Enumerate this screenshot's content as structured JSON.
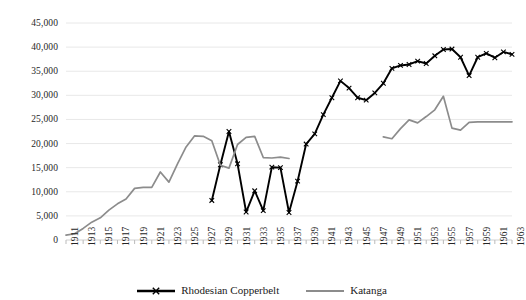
{
  "chart_data": {
    "type": "line",
    "title": "",
    "subtitle": "",
    "xlabel": "",
    "ylabel": "",
    "xlim": [
      1911,
      1963
    ],
    "ylim": [
      0,
      45000
    ],
    "y_ticks": [
      "0",
      "5,000",
      "10,000",
      "15,000",
      "20,000",
      "25,000",
      "30,000",
      "35,000",
      "40,000",
      "45,000"
    ],
    "y_tick_values": [
      0,
      5000,
      10000,
      15000,
      20000,
      25000,
      30000,
      35000,
      40000,
      45000
    ],
    "x_ticks": [
      "1911",
      "1913",
      "1915",
      "1917",
      "1919",
      "1921",
      "1923",
      "1925",
      "1927",
      "1929",
      "1931",
      "1933",
      "1935",
      "1937",
      "1939",
      "1941",
      "1943",
      "1945",
      "1947",
      "1949",
      "1951",
      "1953",
      "1955",
      "1957",
      "1959",
      "1961",
      "1963"
    ],
    "x_tick_values": [
      1911,
      1913,
      1915,
      1917,
      1919,
      1921,
      1923,
      1925,
      1927,
      1929,
      1931,
      1933,
      1935,
      1937,
      1939,
      1941,
      1943,
      1945,
      1947,
      1949,
      1951,
      1953,
      1955,
      1957,
      1959,
      1961,
      1963
    ],
    "grid": true,
    "grid_axis": "y",
    "legend_position": "bottom",
    "series": [
      {
        "name": "Rhodesian Copperbelt",
        "color": "#000000",
        "marker": "x",
        "x": [
          1928,
          1929,
          1930,
          1931,
          1932,
          1933,
          1934,
          1935,
          1936,
          1937,
          1938,
          1939,
          1940,
          1941,
          1942,
          1943,
          1944,
          1945,
          1946,
          1947,
          1948,
          1949,
          1950,
          1951,
          1952,
          1953,
          1954,
          1955,
          1956,
          1957,
          1958,
          1959,
          1960,
          1961,
          1962,
          1963
        ],
        "values": [
          8200,
          15600,
          22500,
          15800,
          5800,
          10200,
          6100,
          15100,
          15000,
          5700,
          12200,
          19900,
          22000,
          26000,
          29500,
          33000,
          31500,
          29500,
          29000,
          30500,
          32500,
          35600,
          36200,
          36400,
          37100,
          36600,
          38200,
          39500,
          39600,
          37900,
          34100,
          37900,
          38700,
          37800,
          39000,
          38500
        ]
      },
      {
        "name": "Katanga",
        "color": "#8c8c8c",
        "marker": "none",
        "x": [
          1911,
          1912,
          1913,
          1914,
          1915,
          1916,
          1917,
          1918,
          1919,
          1920,
          1921,
          1922,
          1923,
          1924,
          1925,
          1926,
          1927,
          1928,
          1929,
          1930,
          1931,
          1932,
          1933,
          1934,
          1935,
          1936,
          1937,
          1938,
          1939,
          1940,
          1941,
          1942,
          1948,
          1949,
          1950,
          1951,
          1952,
          1953,
          1954,
          1955,
          1956,
          1957,
          1958,
          1959,
          1960,
          1961,
          1962,
          1963
        ],
        "values": [
          1000,
          1300,
          2400,
          3700,
          4600,
          6200,
          7500,
          8500,
          10700,
          10900,
          10900,
          14100,
          12000,
          15800,
          19300,
          21600,
          21500,
          20600,
          15500,
          14900,
          19800,
          21300,
          21500,
          17100,
          17000,
          17200,
          16900,
          null,
          null,
          null,
          null,
          null,
          21400,
          21000,
          23100,
          24900,
          24300,
          25600,
          27000,
          29800,
          23200,
          22800,
          24400,
          24500,
          24500,
          24500,
          24500,
          24500
        ]
      }
    ],
    "gaps": [
      {
        "series": "Katanga",
        "from": 1938,
        "to": 1947
      }
    ]
  },
  "legend": {
    "items": [
      {
        "label": "Rhodesian Copperbelt",
        "color": "#000000",
        "marker": "x"
      },
      {
        "label": "Katanga",
        "color": "#8c8c8c",
        "marker": "none"
      }
    ]
  }
}
